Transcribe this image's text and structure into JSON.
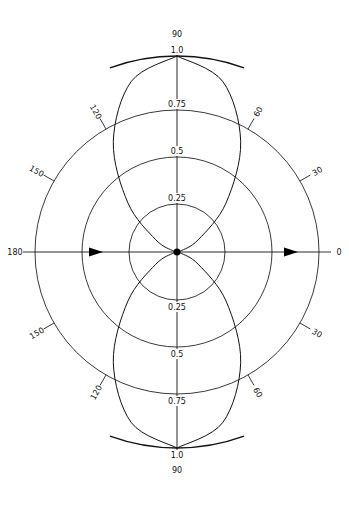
{
  "diagram": {
    "type": "polar-radiation-pattern",
    "center": [
      177,
      252
    ],
    "pixels_per_unit": 190,
    "colors": {
      "line": "#111111",
      "background": "#ffffff"
    },
    "rings": [
      {
        "value": 0.25,
        "radius": 48,
        "label": "0.25"
      },
      {
        "value": 0.5,
        "radius": 95,
        "label": "0.5"
      },
      {
        "value": 0.75,
        "radius": 142,
        "label": "0.75"
      }
    ],
    "unit_arc": {
      "value": 1.0,
      "radius": 196,
      "label": "1.0",
      "span_deg": 20
    },
    "angle_labels": [
      {
        "angle": 90,
        "label": "90",
        "position": "top"
      },
      {
        "angle": 60,
        "label": "60"
      },
      {
        "angle": 30,
        "label": "30"
      },
      {
        "angle": 0,
        "label": "0"
      },
      {
        "angle": -30,
        "label": "30"
      },
      {
        "angle": -60,
        "label": "60"
      },
      {
        "angle": -90,
        "label": "90",
        "position": "bottom"
      },
      {
        "angle": 240,
        "label": "120"
      },
      {
        "angle": 210,
        "label": "150"
      },
      {
        "angle": 180,
        "label": "180"
      },
      {
        "angle": 150,
        "label": "150"
      },
      {
        "angle": 120,
        "label": "120"
      }
    ],
    "ring_labels_top": [
      "1.0",
      "0.75",
      "0.5",
      "0.25"
    ],
    "ring_labels_bottom": [
      "0.25",
      "0.5",
      "0.75",
      "1.0"
    ],
    "pattern": {
      "description": "Figure-eight lobes along 90/270 axis, r ≈ sin^3(theta)",
      "samples_deg": [
        0,
        15,
        30,
        45,
        60,
        75,
        90
      ],
      "r_values": [
        0.0,
        0.017,
        0.125,
        0.354,
        0.65,
        0.901,
        1.0
      ]
    },
    "arrows": [
      {
        "x": 101,
        "direction": "right"
      },
      {
        "x": 296,
        "direction": "right"
      }
    ],
    "origin_dot": true
  }
}
